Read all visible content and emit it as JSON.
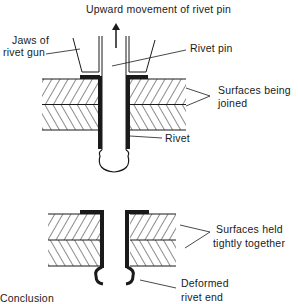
{
  "diagram": {
    "title": "Upward movement of rivet pin",
    "labels": {
      "jaws_line1": "Jaws of",
      "jaws_line2": "rivet gun",
      "rivet_pin": "Rivet pin",
      "surfaces_joined_line1": "Surfaces being",
      "surfaces_joined_line2": "joined",
      "rivet": "Rivet",
      "surfaces_held_line1": "Surfaces held",
      "surfaces_held_line2": "tightly together",
      "deformed_line1": "Deformed",
      "deformed_line2": "rivet end",
      "bottom_left_fragment": "Conclusion"
    },
    "colors": {
      "ink": "#1a1a1a",
      "background": "#ffffff"
    }
  }
}
